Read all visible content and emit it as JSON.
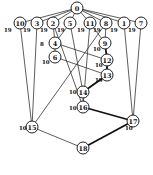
{
  "diagram": {
    "type": "directed-graph",
    "nodes": [
      {
        "id": "0",
        "label": "0",
        "x": 77,
        "y": 8
      },
      {
        "id": "10",
        "label": "10",
        "x": 20,
        "y": 23
      },
      {
        "id": "3",
        "label": "3",
        "x": 37,
        "y": 23
      },
      {
        "id": "2",
        "label": "2",
        "x": 53,
        "y": 23
      },
      {
        "id": "5",
        "label": "5",
        "x": 70,
        "y": 23
      },
      {
        "id": "11",
        "label": "11",
        "x": 90,
        "y": 23
      },
      {
        "id": "8",
        "label": "8",
        "x": 106,
        "y": 23
      },
      {
        "id": "1",
        "label": "1",
        "x": 124,
        "y": 23
      },
      {
        "id": "7",
        "label": "7",
        "x": 141,
        "y": 23
      },
      {
        "id": "4",
        "label": "4",
        "x": 55,
        "y": 43
      },
      {
        "id": "6",
        "label": "6",
        "x": 55,
        "y": 57
      },
      {
        "id": "9",
        "label": "9",
        "x": 105,
        "y": 43
      },
      {
        "id": "12",
        "label": "12",
        "x": 107,
        "y": 60
      },
      {
        "id": "13",
        "label": "13",
        "x": 107,
        "y": 75
      },
      {
        "id": "14",
        "label": "14",
        "x": 83,
        "y": 92
      },
      {
        "id": "16",
        "label": "16",
        "x": 83,
        "y": 107
      },
      {
        "id": "15",
        "label": "15",
        "x": 32,
        "y": 127
      },
      {
        "id": "17",
        "label": "17",
        "x": 133,
        "y": 121
      },
      {
        "id": "18",
        "label": "18",
        "x": 83,
        "y": 148
      }
    ],
    "edges": [
      {
        "from": "0",
        "to": "10",
        "bold": false
      },
      {
        "from": "0",
        "to": "3",
        "bold": false
      },
      {
        "from": "0",
        "to": "2",
        "bold": false
      },
      {
        "from": "0",
        "to": "5",
        "bold": false
      },
      {
        "from": "0",
        "to": "11",
        "bold": false
      },
      {
        "from": "0",
        "to": "8",
        "bold": false
      },
      {
        "from": "0",
        "to": "1",
        "bold": false
      },
      {
        "from": "0",
        "to": "7",
        "bold": false
      },
      {
        "from": "10",
        "to": "15",
        "bold": false
      },
      {
        "from": "3",
        "to": "15",
        "bold": false
      },
      {
        "from": "2",
        "to": "4",
        "bold": false
      },
      {
        "from": "2",
        "to": "16",
        "bold": false
      },
      {
        "from": "5",
        "to": "4",
        "bold": false
      },
      {
        "from": "5",
        "to": "14",
        "bold": false
      },
      {
        "from": "4",
        "to": "6",
        "bold": false
      },
      {
        "from": "4",
        "to": "12",
        "bold": false
      },
      {
        "from": "6",
        "to": "13",
        "bold": false
      },
      {
        "from": "11",
        "to": "9",
        "bold": false
      },
      {
        "from": "11",
        "to": "16",
        "bold": false
      },
      {
        "from": "8",
        "to": "9",
        "bold": false
      },
      {
        "from": "8",
        "to": "15",
        "bold": false
      },
      {
        "from": "9",
        "to": "12",
        "bold": true
      },
      {
        "from": "12",
        "to": "13",
        "bold": true
      },
      {
        "from": "13",
        "to": "14",
        "bold": true
      },
      {
        "from": "14",
        "to": "16",
        "bold": false
      },
      {
        "from": "1",
        "to": "17",
        "bold": false
      },
      {
        "from": "7",
        "to": "17",
        "bold": false
      },
      {
        "from": "16",
        "to": "17",
        "bold": true
      },
      {
        "from": "15",
        "to": "18",
        "bold": false
      },
      {
        "from": "17",
        "to": "18",
        "bold": true
      }
    ],
    "weight_labels": [
      {
        "text": "19",
        "x": 4,
        "y": 32
      },
      {
        "text": "19",
        "x": 23,
        "y": 32
      },
      {
        "text": "19",
        "x": 40,
        "y": 32
      },
      {
        "text": "19",
        "x": 57,
        "y": 32
      },
      {
        "text": "19",
        "x": 77,
        "y": 32
      },
      {
        "text": "19",
        "x": 93,
        "y": 32
      },
      {
        "text": "19",
        "x": 110,
        "y": 32
      },
      {
        "text": "19",
        "x": 128,
        "y": 32
      },
      {
        "text": "8",
        "x": 40,
        "y": 46
      },
      {
        "text": "10",
        "x": 42,
        "y": 64
      },
      {
        "text": "10",
        "x": 93,
        "y": 51
      },
      {
        "text": "10",
        "x": 95,
        "y": 67
      },
      {
        "text": "19",
        "x": 95,
        "y": 82
      },
      {
        "text": "10",
        "x": 69,
        "y": 94
      },
      {
        "text": "10",
        "x": 69,
        "y": 110
      },
      {
        "text": "10",
        "x": 19,
        "y": 130
      },
      {
        "text": "10",
        "x": 125,
        "y": 130
      }
    ]
  }
}
